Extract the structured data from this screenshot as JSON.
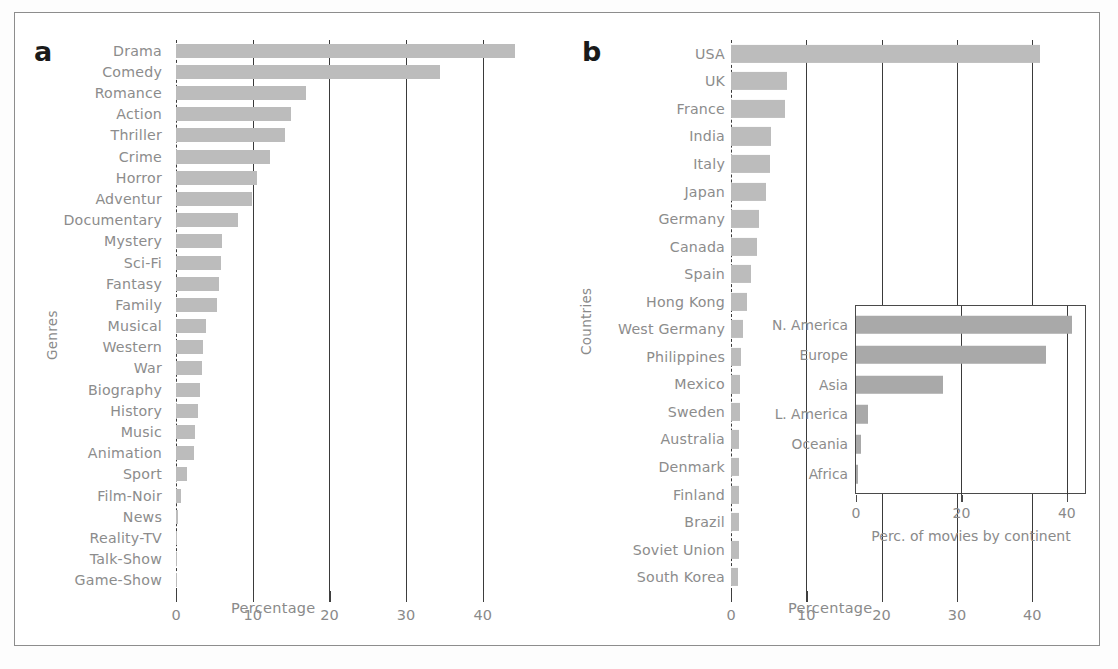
{
  "figure": {
    "panel_a_letter": "a",
    "panel_b_letter": "b"
  },
  "chart_data": [
    {
      "id": "panel_a",
      "type": "bar",
      "orientation": "horizontal",
      "title": "",
      "xlabel": "Percentage",
      "ylabel": "Genres",
      "xlim": [
        0,
        46
      ],
      "xticks": [
        0,
        10,
        20,
        30,
        40
      ],
      "xticklabels": [
        "0",
        "10",
        "20",
        "30",
        "40"
      ],
      "grid": "vertical-gridlines-at-xticks",
      "legend": "none",
      "bar_color": "#bcbcbc",
      "categories": [
        "Drama",
        "Comedy",
        "Romance",
        "Action",
        "Thriller",
        "Crime",
        "Horror",
        "Adventur",
        "Documentary",
        "Mystery",
        "Sci-Fi",
        "Fantasy",
        "Family",
        "Musical",
        "Western",
        "War",
        "Biography",
        "History",
        "Music",
        "Animation",
        "Sport",
        "Film-Noir",
        "News",
        "Reality-TV",
        "Talk-Show",
        "Game-Show"
      ],
      "values": [
        44.2,
        34.4,
        17.0,
        15.0,
        14.2,
        12.2,
        10.6,
        9.9,
        8.1,
        6.0,
        5.9,
        5.6,
        5.4,
        3.9,
        3.5,
        3.4,
        3.1,
        2.9,
        2.5,
        2.4,
        1.4,
        0.6,
        0.06,
        0.04,
        0.03,
        0.02
      ]
    },
    {
      "id": "panel_b",
      "type": "bar",
      "orientation": "horizontal",
      "title": "",
      "xlabel": "Percentage",
      "ylabel": "Countries",
      "xlim": [
        0,
        46
      ],
      "xticks": [
        0,
        10,
        20,
        30,
        40
      ],
      "xticklabels": [
        "0",
        "10",
        "20",
        "30",
        "40"
      ],
      "grid": "vertical-gridlines-at-xticks",
      "legend": "none",
      "bar_color": "#bcbcbc",
      "categories": [
        "USA",
        "UK",
        "France",
        "India",
        "Italy",
        "Japan",
        "Germany",
        "Canada",
        "Spain",
        "Hong Kong",
        "West Germany",
        "Philippines",
        "Mexico",
        "Sweden",
        "Australia",
        "Denmark",
        "Finland",
        "Brazil",
        "Soviet Union",
        "South Korea"
      ],
      "values": [
        41.0,
        7.4,
        7.2,
        5.3,
        5.2,
        4.7,
        3.7,
        3.5,
        2.6,
        2.1,
        1.6,
        1.3,
        1.2,
        1.2,
        1.1,
        1.1,
        1.1,
        1.0,
        1.0,
        0.9
      ]
    },
    {
      "id": "panel_b_inset",
      "type": "bar",
      "orientation": "horizontal",
      "title": "",
      "xlabel": "Perc. of movies by continent",
      "ylabel": "",
      "xlim": [
        0,
        44
      ],
      "xticks": [
        0,
        20,
        40
      ],
      "xticklabels": [
        "0",
        "20",
        "40"
      ],
      "grid": "vertical-gridlines-at-xticks",
      "legend": "none",
      "bar_color": "#a9a9a9",
      "categories": [
        "N. America",
        "Europe",
        "Asia",
        "L. America",
        "Oceania",
        "Africa"
      ],
      "values": [
        41.0,
        36.0,
        16.5,
        2.2,
        1.0,
        0.4
      ]
    }
  ]
}
